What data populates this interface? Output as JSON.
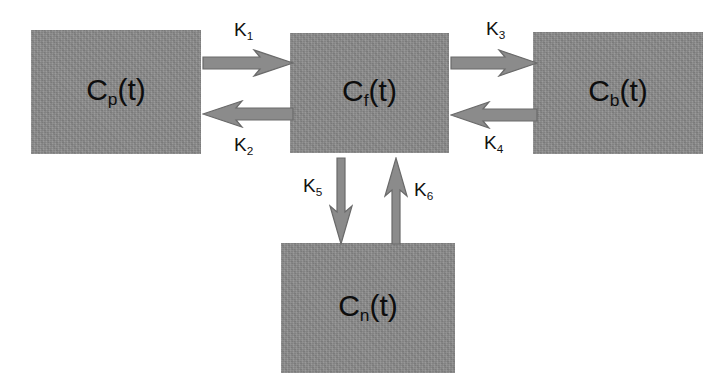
{
  "diagram": {
    "type": "compartmental-model",
    "background_color": "#ffffff",
    "box_fill_color": "#8b8b8b",
    "text_color": "#0d0d0d",
    "arrow_color": "#8b8b8b",
    "arrow_outline_color": "#5f5f5f",
    "compartments": [
      {
        "id": "plasma",
        "label_main": "C",
        "label_sub": "p",
        "label_suffix": "(t)",
        "label_text": "Cp(t)",
        "position": "left"
      },
      {
        "id": "free",
        "label_main": "C",
        "label_sub": "f",
        "label_suffix": "(t)",
        "label_text": "Cf(t)",
        "position": "center"
      },
      {
        "id": "bound",
        "label_main": "C",
        "label_sub": "b",
        "label_suffix": "(t)",
        "label_text": "Cb(t)",
        "position": "right"
      },
      {
        "id": "nonspecific",
        "label_main": "C",
        "label_sub": "n",
        "label_suffix": "(t)",
        "label_text": "Cn(t)",
        "position": "bottom"
      }
    ],
    "rate_constants": [
      {
        "id": "k1",
        "main": "K",
        "sub": "1",
        "text": "K1",
        "from": "plasma",
        "to": "free",
        "direction": "right"
      },
      {
        "id": "k2",
        "main": "K",
        "sub": "2",
        "text": "K2",
        "from": "free",
        "to": "plasma",
        "direction": "left"
      },
      {
        "id": "k3",
        "main": "K",
        "sub": "3",
        "text": "K3",
        "from": "free",
        "to": "bound",
        "direction": "right"
      },
      {
        "id": "k4",
        "main": "K",
        "sub": "4",
        "text": "K4",
        "from": "bound",
        "to": "free",
        "direction": "left"
      },
      {
        "id": "k5",
        "main": "K",
        "sub": "5",
        "text": "K5",
        "from": "free",
        "to": "nonspecific",
        "direction": "down"
      },
      {
        "id": "k6",
        "main": "K",
        "sub": "6",
        "text": "K6",
        "from": "nonspecific",
        "to": "free",
        "direction": "up"
      }
    ]
  }
}
